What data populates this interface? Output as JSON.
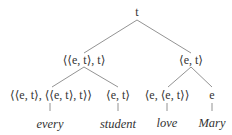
{
  "tree": {
    "root": {
      "label": "t"
    },
    "level2": [
      {
        "label": "⟨⟨e, t⟩, t⟩"
      },
      {
        "label": "⟨e, t⟩"
      }
    ],
    "level3": [
      {
        "label": "⟨⟨e, t⟩, ⟨⟨e, t⟩, t⟩⟩"
      },
      {
        "label": "⟨e, t⟩"
      },
      {
        "label": "⟨e, ⟨e, t⟩⟩"
      },
      {
        "label": "e"
      }
    ],
    "leaves": [
      {
        "label": "every"
      },
      {
        "label": "student"
      },
      {
        "label": "love"
      },
      {
        "label": "Mary"
      }
    ]
  },
  "colors": {
    "line": "#777777",
    "text": "#333333",
    "background": "#ffffff"
  }
}
